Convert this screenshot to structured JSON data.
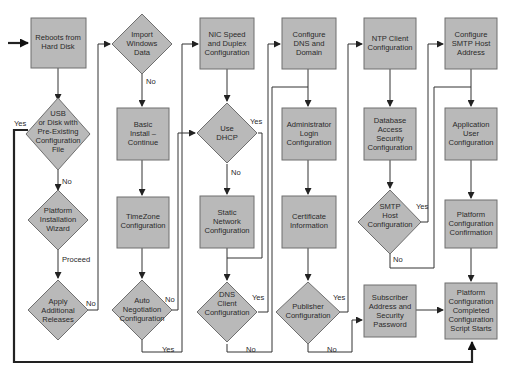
{
  "diagram": {
    "type": "flowchart",
    "colors": {
      "node_fill": "#b9b9b9",
      "node_stroke": "#6f6f6f",
      "line": "#333333",
      "text": "#2a2a2a",
      "background": "#ffffff"
    },
    "nodes": [
      {
        "id": "reboots",
        "shape": "box",
        "lines": [
          "Reboots from",
          "Hard Disk"
        ]
      },
      {
        "id": "usb",
        "shape": "diamond",
        "lines": [
          "USB",
          "or Disk with",
          "Pre-Existing",
          "Configuration",
          "File"
        ]
      },
      {
        "id": "wizard",
        "shape": "diamond",
        "lines": [
          "Platform",
          "Installation",
          "Wizard"
        ]
      },
      {
        "id": "apply",
        "shape": "diamond",
        "lines": [
          "Apply",
          "Additional",
          "Releases"
        ]
      },
      {
        "id": "import",
        "shape": "diamond",
        "lines": [
          "Import",
          "Windows",
          "Data"
        ]
      },
      {
        "id": "basic",
        "shape": "box",
        "lines": [
          "Basic",
          "Install –",
          "Continue"
        ]
      },
      {
        "id": "timezone",
        "shape": "box",
        "lines": [
          "TimeZone",
          "Configuration"
        ]
      },
      {
        "id": "autoneg",
        "shape": "diamond",
        "lines": [
          "Auto",
          "Negotiation",
          "Configuration"
        ]
      },
      {
        "id": "nic",
        "shape": "box",
        "lines": [
          "NIC Speed",
          "and Duplex",
          "Configuration"
        ]
      },
      {
        "id": "dhcp",
        "shape": "diamond",
        "lines": [
          "Use",
          "DHCP"
        ]
      },
      {
        "id": "static",
        "shape": "box",
        "lines": [
          "Static",
          "Network",
          "Configuration"
        ]
      },
      {
        "id": "dnsclient",
        "shape": "diamond",
        "lines": [
          "DNS",
          "Client",
          "Configuration"
        ]
      },
      {
        "id": "dns",
        "shape": "box",
        "lines": [
          "Configure",
          "DNS and",
          "Domain"
        ]
      },
      {
        "id": "admin",
        "shape": "box",
        "lines": [
          "Administrator",
          "Login",
          "Configuration"
        ]
      },
      {
        "id": "cert",
        "shape": "box",
        "lines": [
          "Certificate",
          "Information"
        ]
      },
      {
        "id": "publisher",
        "shape": "diamond",
        "lines": [
          "Publisher",
          "Configuration"
        ]
      },
      {
        "id": "ntp",
        "shape": "box",
        "lines": [
          "NTP Client",
          "Configuration"
        ]
      },
      {
        "id": "dbaccess",
        "shape": "box",
        "lines": [
          "Database",
          "Access",
          "Security",
          "Configuration"
        ]
      },
      {
        "id": "smtp",
        "shape": "diamond",
        "lines": [
          "SMTP",
          "Host",
          "Configuration"
        ]
      },
      {
        "id": "subscriber",
        "shape": "box",
        "lines": [
          "Subscriber",
          "Address and",
          "Security",
          "Password"
        ]
      },
      {
        "id": "smtphost",
        "shape": "box",
        "lines": [
          "Configure",
          "SMTP Host",
          "Address"
        ]
      },
      {
        "id": "appuser",
        "shape": "box",
        "lines": [
          "Application",
          "User",
          "Configuration"
        ]
      },
      {
        "id": "confirm",
        "shape": "box",
        "lines": [
          "Platform",
          "Configuration",
          "Confirmation"
        ]
      },
      {
        "id": "completed",
        "shape": "box",
        "lines": [
          "Platform",
          "Configuration",
          "Completed",
          "Configuration",
          "Script Starts"
        ]
      }
    ],
    "edge_labels": {
      "usb_yes": "Yes",
      "usb_no": "No",
      "wizard_proceed": "Proceed",
      "apply_no": "No",
      "import_no": "No",
      "autoneg_no": "No",
      "autoneg_yes": "Yes",
      "dhcp_yes": "Yes",
      "dhcp_no": "No",
      "dnsclient_yes": "Yes",
      "dnsclient_no": "No",
      "publisher_yes": "Yes",
      "publisher_no": "No",
      "smtp_yes": "Yes",
      "smtp_no": "No"
    }
  }
}
